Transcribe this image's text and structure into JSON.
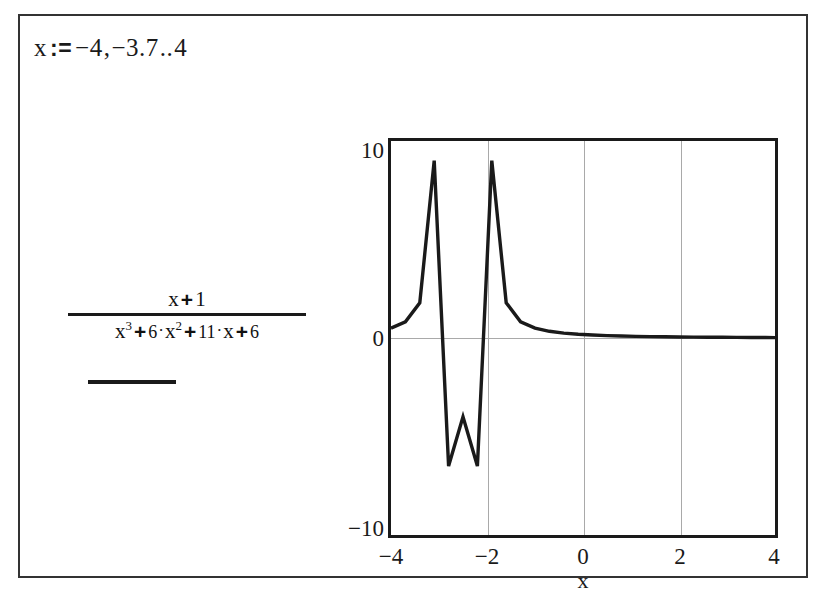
{
  "worksheet": {
    "range_definition": {
      "variable": "x",
      "assign_operator": ":=",
      "start": "−4",
      "comma": ",",
      "second": "−3.7",
      "range_operator": "..",
      "end": "4"
    },
    "expression": {
      "numerator": {
        "term1": "x",
        "op1": "+",
        "term2": "1"
      },
      "denominator": {
        "t1_base": "x",
        "t1_exp": "3",
        "op1": "+",
        "t2_coef": "6",
        "t2_dot": "·",
        "t2_base": "x",
        "t2_exp": "2",
        "op2": "+",
        "t3_coef": "11",
        "t3_dot": "·",
        "t3_base": "x",
        "op3": "+",
        "t4": "6"
      }
    }
  },
  "chart_data": {
    "type": "line",
    "title": "",
    "xlabel": "x",
    "ylabel": "",
    "xlim": [
      -4,
      4
    ],
    "ylim": [
      -10,
      10
    ],
    "xticks": [
      "−4",
      "−2",
      "0",
      "2",
      "4"
    ],
    "xtick_values": [
      -4,
      -2,
      0,
      2,
      4
    ],
    "yticks": [
      "10",
      "0",
      "−10"
    ],
    "ytick_values": [
      10,
      0,
      -10
    ],
    "grid": true,
    "gridlines_v": [
      -2,
      0,
      2
    ],
    "gridlines_h": [
      0
    ],
    "legend": "none",
    "expression": "(x + 1) / (x^3 + 6*x^2 + 11*x + 6)",
    "step": 0.3,
    "poles": [
      -3,
      -2
    ],
    "series": [
      {
        "name": "f(x)",
        "color": "#1a1a1a",
        "x": [
          -4,
          -3.7,
          -3.4,
          -3.1,
          -2.8,
          -2.5,
          -2.2,
          -1.9,
          -1.6,
          -1.3,
          -1,
          -0.7,
          -0.4,
          -0.1,
          0.2,
          0.5,
          0.8,
          1.1,
          1.4,
          1.7,
          2,
          2.3,
          2.6,
          2.9,
          3.2,
          3.5,
          3.8,
          4
        ],
        "y": [
          0.5,
          0.82,
          1.79,
          9.0,
          -6.5,
          -4.0,
          -6.5,
          9.0,
          1.79,
          0.82,
          0.5,
          0.34,
          0.25,
          0.19,
          0.15,
          0.12,
          0.1,
          0.08,
          0.07,
          0.06,
          0.05,
          0.045,
          0.04,
          0.035,
          0.03,
          0.025,
          0.022,
          0.02
        ]
      }
    ]
  }
}
